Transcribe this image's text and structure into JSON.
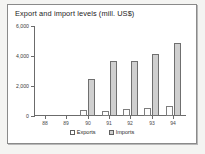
{
  "chart_data": {
    "type": "bar",
    "title": "Export and import levels (mill. US$)",
    "xlabel": "",
    "ylabel": "",
    "categories": [
      "88",
      "89",
      "90",
      "91",
      "92",
      "93",
      "94"
    ],
    "series": [
      {
        "name": "Exports",
        "values": [
          0,
          0,
          400,
          350,
          450,
          530,
          670
        ],
        "color": "#ffffff"
      },
      {
        "name": "Imports",
        "values": [
          0,
          0,
          2500,
          3700,
          3700,
          4150,
          4900
        ],
        "color": "#cfcfcf"
      }
    ],
    "ylim": [
      0,
      6000
    ],
    "yticks": [
      0,
      2000,
      4000,
      6000
    ],
    "ytick_labels": [
      "0",
      "2,000",
      "4,000",
      "6,000"
    ],
    "grid": false,
    "legend_position": "bottom"
  },
  "legend": {
    "exports_label": "Exports",
    "imports_label": "Imports"
  }
}
